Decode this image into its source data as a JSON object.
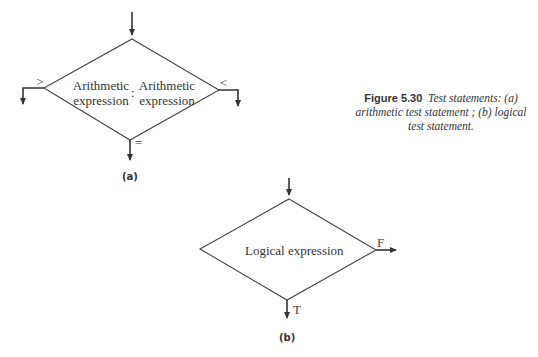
{
  "figure": {
    "number": "Figure 5.30",
    "caption": "Test statements: (a) arithmetic test statement ; (b) logical test statement."
  },
  "diagram_a": {
    "sublabel": "(a)",
    "left_text": [
      "Arithmetic",
      "expression"
    ],
    "separator": ":",
    "right_text": [
      "Arithmetic",
      "expression"
    ],
    "branches": {
      "left": ">",
      "right": "<",
      "bottom": "="
    }
  },
  "diagram_b": {
    "sublabel": "(b)",
    "text": "Logical expression",
    "branches": {
      "right": "F",
      "bottom": "T"
    }
  },
  "colors": {
    "line": "#333333",
    "background": "#ffffff"
  }
}
